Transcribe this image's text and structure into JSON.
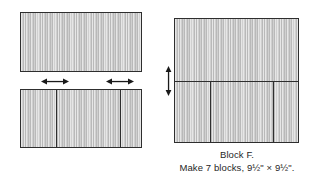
{
  "figure": {
    "kind": "quilt-block-assembly-diagram",
    "canvas": {
      "width": 319,
      "height": 178,
      "background": "#ffffff"
    },
    "colors": {
      "fabric_fill": "#c8c8c8",
      "outline": "#2e2e2e",
      "arrow": "#1a1a1a",
      "text": "#262626"
    }
  },
  "left_column": {
    "step_top": {
      "label": "top-unit-rectangle",
      "x": 20,
      "y": 12,
      "width": 122,
      "height": 60,
      "segments": 1
    },
    "step_bottom": {
      "label": "bottom-unit-rectangle",
      "x": 20,
      "y": 89,
      "width": 122,
      "height": 59,
      "segments": 3,
      "divider_x": [
        56,
        120
      ]
    },
    "press_arrows": [
      {
        "name": "press-arrow-left",
        "x": 41,
        "y": 77,
        "width": 28,
        "direction": "horizontal-double"
      },
      {
        "name": "press-arrow-right",
        "x": 106,
        "y": 77,
        "width": 28,
        "direction": "horizontal-double"
      }
    ]
  },
  "right_column": {
    "assembled_block": {
      "label": "assembled-block-square",
      "x": 174,
      "y": 18,
      "width": 125,
      "height": 125,
      "horizontal_seam_y": 81,
      "bottom_divider_x": [
        210,
        273
      ]
    },
    "press_arrow": {
      "name": "press-arrow-vertical",
      "x": 164,
      "y": 66,
      "height": 30,
      "direction": "vertical-double"
    }
  },
  "caption": {
    "line1": "Block F.",
    "line2": "Make 7 blocks, 9½\" × 9½\"."
  }
}
